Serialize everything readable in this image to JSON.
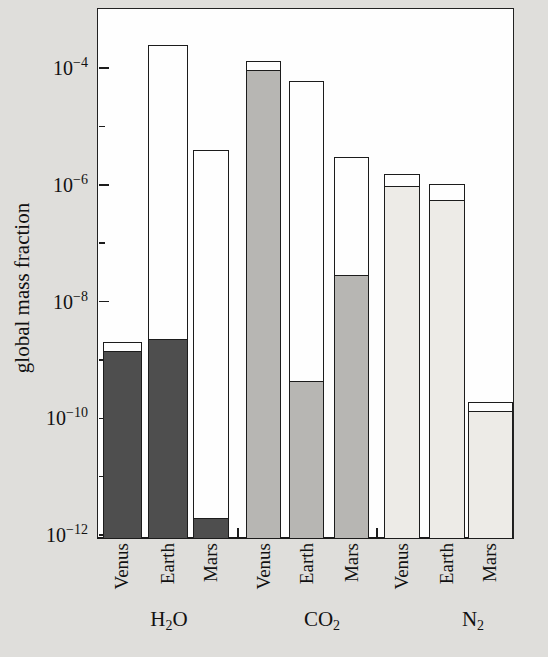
{
  "figure": {
    "kind": "grouped-log-bar-chart",
    "background_color": "#dfdedb",
    "plot_background_color": "#fefefe",
    "outline_color": "#1c1c1c"
  },
  "y_axis": {
    "label": "global mass fraction",
    "scale": "log",
    "major_ticks": [
      {
        "exponent": -4,
        "label": "10−4"
      },
      {
        "exponent": -6,
        "label": "10−6"
      },
      {
        "exponent": -8,
        "label": "10−8"
      },
      {
        "exponent": -10,
        "label": "10−10"
      },
      {
        "exponent": -12,
        "label": "10−12"
      }
    ],
    "minor_tick_exponents": [
      -5,
      -7,
      -9,
      -11
    ]
  },
  "chart_data": {
    "type": "bar",
    "title": "",
    "xlabel": "",
    "ylabel": "global mass fraction",
    "yscale": "log",
    "ylim": [
      1e-12,
      0.0008
    ],
    "legend": "none",
    "note": "Each bar: outer open (white) bar top = larger inventory value; inner shaded bar top = smaller (filled) value. Values are global mass fractions read from the log axis.",
    "groups": [
      {
        "label": "H2O",
        "label_parts": [
          {
            "t": "H"
          },
          {
            "t": "2",
            "sub": true
          },
          {
            "t": "O"
          }
        ],
        "fill_color": "#4e4e4e",
        "bars": [
          {
            "planet": "Venus",
            "open_bar": 2e-09,
            "filled_bar": 1.5e-09
          },
          {
            "planet": "Earth",
            "open_bar": 0.00025,
            "filled_bar": 2.4e-09
          },
          {
            "planet": "Mars",
            "open_bar": 4e-06,
            "filled_bar": 2e-12
          }
        ]
      },
      {
        "label": "CO2",
        "label_parts": [
          {
            "t": "CO"
          },
          {
            "t": "2",
            "sub": true
          }
        ],
        "fill_color": "#b7b6b3",
        "bars": [
          {
            "planet": "Venus",
            "open_bar": 0.00013,
            "filled_bar": 9.5e-05
          },
          {
            "planet": "Earth",
            "open_bar": 6e-05,
            "filled_bar": 4.5e-10
          },
          {
            "planet": "Mars",
            "open_bar": 3e-06,
            "filled_bar": 3e-08
          }
        ]
      },
      {
        "label": "N2",
        "label_parts": [
          {
            "t": "N"
          },
          {
            "t": "2",
            "sub": true
          }
        ],
        "fill_color": "#edebe7",
        "bars": [
          {
            "planet": "Venus",
            "open_bar": 1.5e-06,
            "filled_bar": 1e-06
          },
          {
            "planet": "Earth",
            "open_bar": 1.05e-06,
            "filled_bar": 5.7e-07
          },
          {
            "planet": "Mars",
            "open_bar": 1.9e-10,
            "filled_bar": 1.4e-10
          }
        ]
      }
    ]
  }
}
